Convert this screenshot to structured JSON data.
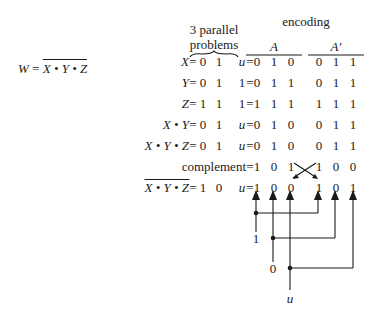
{
  "formula": {
    "lhs": "W",
    "eq": "=",
    "rhs": "X • Y • Z",
    "rhs_overlined": true
  },
  "header": {
    "parallel_line1": "3 parallel",
    "parallel_line2": "problems",
    "encoding": "encoding",
    "group_a": "A",
    "group_a_prime": "A′"
  },
  "rows": [
    {
      "label": "X",
      "overline": false,
      "vals": [
        "0",
        "1",
        "u"
      ],
      "a": [
        "0",
        "1",
        "0"
      ],
      "ap": [
        "0",
        "1",
        "1"
      ]
    },
    {
      "label": "Y",
      "overline": false,
      "vals": [
        "0",
        "1",
        "1"
      ],
      "a": [
        "0",
        "1",
        "1"
      ],
      "ap": [
        "0",
        "1",
        "1"
      ]
    },
    {
      "label": "Z",
      "overline": false,
      "vals": [
        "1",
        "1",
        "1"
      ],
      "a": [
        "1",
        "1",
        "1"
      ],
      "ap": [
        "1",
        "1",
        "1"
      ]
    },
    {
      "label": "X • Y",
      "overline": false,
      "vals": [
        "0",
        "1",
        "u"
      ],
      "a": [
        "0",
        "1",
        "0"
      ],
      "ap": [
        "0",
        "1",
        "1"
      ]
    },
    {
      "label": "X • Y • Z",
      "overline": false,
      "vals": [
        "0",
        "1",
        "u"
      ],
      "a": [
        "0",
        "1",
        "0"
      ],
      "ap": [
        "0",
        "1",
        "1"
      ]
    },
    {
      "label": "complement",
      "overline": false,
      "vals": [],
      "a": [
        "1",
        "0",
        "1"
      ],
      "ap": [
        "1",
        "0",
        "0"
      ]
    },
    {
      "label": "X • Y • Z",
      "overline": true,
      "vals": [
        "1",
        "0",
        "u"
      ],
      "a": [
        "1",
        "0",
        "0"
      ],
      "ap": [
        "1",
        "0",
        "1"
      ]
    }
  ],
  "wiring": {
    "inputs": [
      "1",
      "0",
      "u"
    ]
  }
}
